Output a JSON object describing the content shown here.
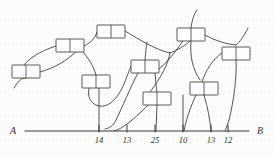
{
  "figure": {
    "type": "hand-drawn-network-diagram",
    "background_color": "#fdfdfc",
    "line_color": "#44423f"
  },
  "axis": {
    "left_label": "A",
    "right_label": "B",
    "x_start": 25,
    "x_end": 249,
    "y": 131,
    "ticks": [
      {
        "label": "14",
        "x": 99
      },
      {
        "label": "13",
        "x": 127
      },
      {
        "label": "25",
        "x": 155
      },
      {
        "label": "10",
        "x": 183
      },
      {
        "label": "13",
        "x": 211
      },
      {
        "label": "12",
        "x": 228
      }
    ]
  },
  "nodes": [
    {
      "id": "n1",
      "x": 12,
      "y": 65,
      "w": 28,
      "h": 13
    },
    {
      "id": "n2",
      "x": 56,
      "y": 39,
      "w": 28,
      "h": 13
    },
    {
      "id": "n3",
      "x": 97,
      "y": 25,
      "w": 28,
      "h": 13
    },
    {
      "id": "n4",
      "x": 82,
      "y": 75,
      "w": 28,
      "h": 13
    },
    {
      "id": "n5",
      "x": 131,
      "y": 60,
      "w": 28,
      "h": 13
    },
    {
      "id": "n6",
      "x": 143,
      "y": 92,
      "w": 28,
      "h": 13
    },
    {
      "id": "n7",
      "x": 177,
      "y": 28,
      "w": 28,
      "h": 13
    },
    {
      "id": "n8",
      "x": 190,
      "y": 82,
      "w": 28,
      "h": 13
    },
    {
      "id": "n9",
      "x": 222,
      "y": 47,
      "w": 28,
      "h": 13
    }
  ],
  "edges": [
    {
      "id": "e1",
      "path": "M 14 88 C 18 82, 20 78, 26 78"
    },
    {
      "id": "e2",
      "path": "M 24 65 C 30 58, 38 52, 56 46"
    },
    {
      "id": "e3",
      "path": "M 40 72 C 54 68, 66 62, 80 48"
    },
    {
      "id": "e4",
      "path": "M 84 46 C 92 42, 95 38, 97 32"
    },
    {
      "id": "e5",
      "path": "M 80 48 C 88 58, 93 64, 96 75"
    },
    {
      "id": "e6",
      "path": "M 125 31 C 140 40, 156 50, 170 53"
    },
    {
      "id": "e7",
      "path": "M 170 53 C 178 50, 186 45, 190 41"
    },
    {
      "id": "e8",
      "path": "M 170 53 C 168 64, 162 76, 150 92"
    },
    {
      "id": "e9",
      "path": "M 96 75 C 86 88, 86 100, 96 105 C 108 110, 118 98, 124 84 C 128 74, 130 68, 131 66"
    },
    {
      "id": "e10",
      "path": "M 99 88 L 99 131"
    },
    {
      "id": "e11",
      "path": "M 145 60 C 146 52, 146 46, 147 42"
    },
    {
      "id": "e12",
      "path": "M 138 73 C 130 88, 122 108, 116 120 C 113 126, 110 128, 105 129"
    },
    {
      "id": "e13",
      "path": "M 155 73 C 156 82, 156 88, 157 92"
    },
    {
      "id": "e14",
      "path": "M 157 105 L 156 131"
    },
    {
      "id": "e15",
      "path": "M 148 105 C 140 113, 132 121, 124 126 C 120 129, 117 130, 114 131"
    },
    {
      "id": "e16",
      "path": "M 191 28 C 192 20, 194 14, 197 10"
    },
    {
      "id": "e17",
      "path": "M 205 35 C 216 41, 226 44, 236 45"
    },
    {
      "id": "e18",
      "path": "M 191 41 C 190 56, 192 68, 200 80"
    },
    {
      "id": "e19",
      "path": "M 183 41 C 175 52, 168 62, 158 70"
    },
    {
      "id": "e20",
      "path": "M 183 95 L 183 131"
    },
    {
      "id": "e21",
      "path": "M 236 45 C 240 42, 244 36, 248 28"
    },
    {
      "id": "e22",
      "path": "M 236 60 C 237 76, 234 100, 229 120 C 227 126, 226 129, 225 131"
    },
    {
      "id": "e23",
      "path": "M 204 95 C 208 108, 210 120, 211 131"
    },
    {
      "id": "e24",
      "path": "M 196 95 C 190 108, 186 120, 184 131"
    },
    {
      "id": "e25",
      "path": "M 222 53 C 212 60, 206 70, 202 82"
    }
  ]
}
